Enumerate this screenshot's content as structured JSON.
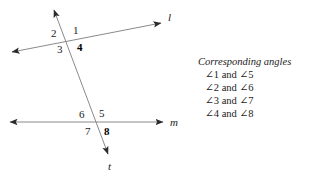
{
  "figure": {
    "background_color": "#ffffff",
    "stroke_color": "#8a8a8a",
    "arrow_color": "#2b2b2b",
    "text_color": "#1b1b1b",
    "lines": [
      {
        "name": "line-l",
        "label": "l",
        "label_x": 168,
        "label_y": 12,
        "x1": 12,
        "y1": 52,
        "x2": 161,
        "y2": 23,
        "arrow_start": true,
        "arrow_end": true
      },
      {
        "name": "line-m",
        "label": "m",
        "label_x": 170,
        "label_y": 117,
        "x1": 10,
        "y1": 122,
        "x2": 163,
        "y2": 122,
        "arrow_start": true,
        "arrow_end": true
      },
      {
        "name": "transversal-t",
        "label": "t",
        "label_x": 108,
        "label_y": 161,
        "x1": 54,
        "y1": 10,
        "x2": 108,
        "y2": 154,
        "arrow_start": true,
        "arrow_end": true
      }
    ],
    "intersections": [
      {
        "name": "upper-intersection",
        "x": 68,
        "y": 40
      },
      {
        "name": "lower-intersection",
        "x": 96,
        "y": 122
      }
    ],
    "angle_labels": [
      {
        "id": "1",
        "text": "1",
        "x": 73,
        "y": 25,
        "bold": false
      },
      {
        "id": "2",
        "text": "2",
        "x": 51,
        "y": 28,
        "bold": false
      },
      {
        "id": "3",
        "text": "3",
        "x": 57,
        "y": 44,
        "bold": false
      },
      {
        "id": "4",
        "text": "4",
        "x": 77,
        "y": 42,
        "bold": true
      },
      {
        "id": "5",
        "text": "5",
        "x": 99,
        "y": 108,
        "bold": false
      },
      {
        "id": "6",
        "text": "6",
        "x": 79,
        "y": 109,
        "bold": false
      },
      {
        "id": "7",
        "text": "7",
        "x": 85,
        "y": 126,
        "bold": false
      },
      {
        "id": "8",
        "text": "8",
        "x": 104,
        "y": 126,
        "bold": true
      }
    ]
  },
  "legend": {
    "title": "Corresponding angles",
    "pairs": [
      "∠1 and ∠5",
      "∠2 and ∠6",
      "∠3 and ∠7",
      "∠4 and ∠8"
    ]
  }
}
